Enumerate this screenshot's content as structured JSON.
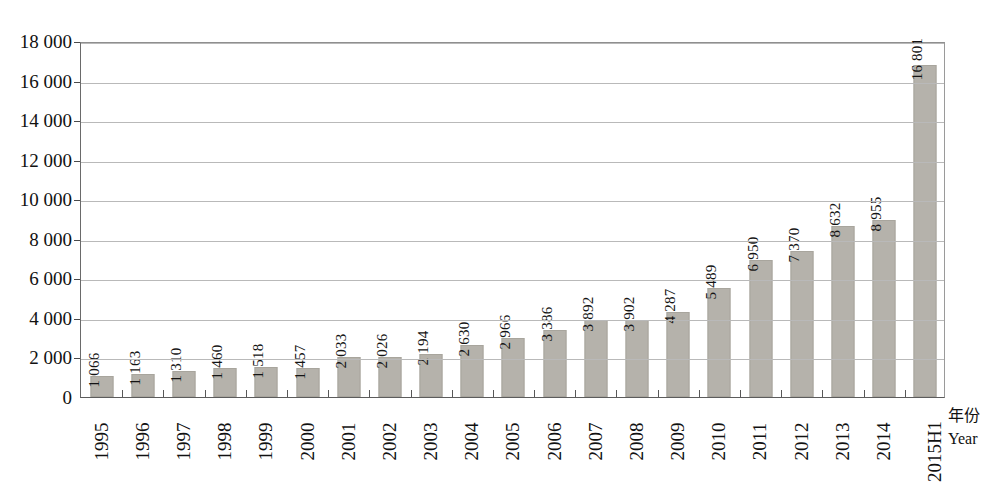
{
  "chart_data": {
    "type": "bar",
    "title": "",
    "subtitle": "",
    "xlabel_cn": "年份",
    "xlabel_en": "Year",
    "ylabel": "",
    "ylim": [
      0,
      18000
    ],
    "ytick_step": 2000,
    "grid": true,
    "legend": "none",
    "bar_color": "#b5b2ab",
    "thousands_separator": " ",
    "categories": [
      "1995",
      "1996",
      "1997",
      "1998",
      "1999",
      "2000",
      "2001",
      "2002",
      "2003",
      "2004",
      "2005",
      "2006",
      "2007",
      "2008",
      "2009",
      "2010",
      "2011",
      "2012",
      "2013",
      "2014",
      "2015H1"
    ],
    "values": [
      1066,
      1163,
      1310,
      1460,
      1518,
      1457,
      2033,
      2026,
      2194,
      2630,
      2966,
      3386,
      3892,
      3902,
      4287,
      5489,
      6950,
      7370,
      8632,
      8955,
      16801
    ],
    "value_labels": [
      "1 066",
      "1 163",
      "1 310",
      "1 460",
      "1 518",
      "1 457",
      "2 033",
      "2 026",
      "2 194",
      "2 630",
      "2 966",
      "3 386",
      "3 892",
      "3 902",
      "4 287",
      "5 489",
      "6 950",
      "7 370",
      "8 632",
      "8 955",
      "16 801"
    ],
    "ytick_labels": [
      "18 000",
      "16 000",
      "14 000",
      "12 000",
      "10 000",
      "8 000",
      "6 000",
      "4 000",
      "2 000",
      "0"
    ],
    "ytick_values": [
      18000,
      16000,
      14000,
      12000,
      10000,
      8000,
      6000,
      4000,
      2000,
      0
    ]
  }
}
